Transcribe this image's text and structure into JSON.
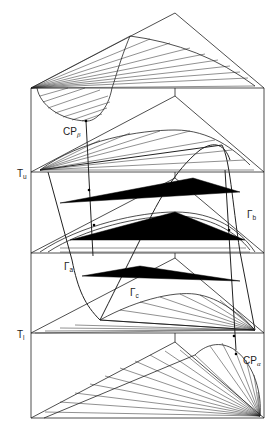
{
  "diagram": {
    "labels": {
      "T_upper": {
        "main": "T",
        "sub": "u"
      },
      "T_lower": {
        "main": "T",
        "sub": "l"
      },
      "CP_beta": {
        "main": "CP",
        "sub": "β"
      },
      "CP_alpha": {
        "main": "CP",
        "sub": "α"
      },
      "Gamma_a": {
        "main": "Γ",
        "sub": "a"
      },
      "Gamma_b": {
        "main": "Γ",
        "sub": "b"
      },
      "Gamma_c": {
        "main": "Γ",
        "sub": "c"
      }
    },
    "colors": {
      "line": "#222222",
      "fill": "#000000",
      "background": "#ffffff"
    }
  }
}
